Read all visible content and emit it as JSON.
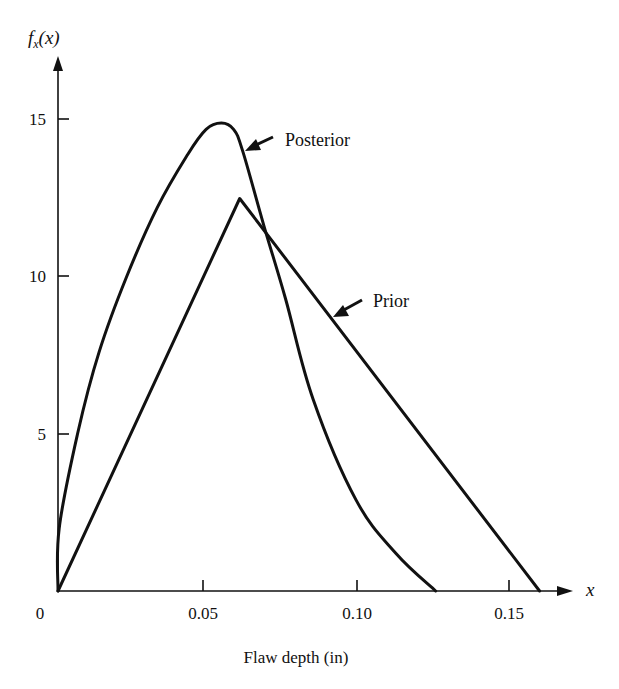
{
  "chart_data": {
    "type": "line",
    "title": "",
    "xlabel": "Flaw depth (in)",
    "ylabel": "f_x(x)",
    "x_axis_symbol": "x",
    "xlim": [
      0,
      0.17
    ],
    "ylim": [
      0,
      17
    ],
    "origin_label": "0",
    "x_ticks": [
      0.05,
      0.1,
      0.15
    ],
    "x_tick_labels": [
      "0.05",
      "0.10",
      "0.15"
    ],
    "y_ticks": [
      5,
      10,
      15
    ],
    "y_tick_labels": [
      "5",
      "10",
      "15"
    ],
    "grid": false,
    "legend": "inline annotations with arrows",
    "series": [
      {
        "name": "Posterior",
        "points": [
          [
            0,
            0
          ],
          [
            0.003,
            2.0
          ],
          [
            0.009,
            5.0
          ],
          [
            0.016,
            7.6
          ],
          [
            0.025,
            10.0
          ],
          [
            0.035,
            12.2
          ],
          [
            0.045,
            13.9
          ],
          [
            0.051,
            14.7
          ],
          [
            0.056,
            14.9
          ],
          [
            0.06,
            14.7
          ],
          [
            0.063,
            14.0
          ],
          [
            0.07,
            11.6
          ],
          [
            0.077,
            9.3
          ],
          [
            0.086,
            6.1
          ],
          [
            0.1,
            2.9
          ],
          [
            0.113,
            1.2
          ],
          [
            0.126,
            0
          ]
        ]
      },
      {
        "name": "Prior",
        "points": [
          [
            0,
            0
          ],
          [
            0.062,
            12.5
          ],
          [
            0.16,
            0
          ]
        ]
      }
    ],
    "annotations": [
      {
        "text": "Posterior",
        "points_to": [
          0.063,
          14.0
        ]
      },
      {
        "text": "Prior",
        "points_to": [
          0.092,
          8.6
        ]
      }
    ]
  },
  "labels": {
    "y_axis": "f",
    "y_axis_sub": "x",
    "y_axis_paren": "(x)",
    "x_axis_symbol": "x",
    "x_title": "Flaw depth (in)",
    "origin": "0",
    "x_tick_1": "0.05",
    "x_tick_2": "0.10",
    "x_tick_3": "0.15",
    "y_tick_1": "5",
    "y_tick_2": "10",
    "y_tick_3": "15",
    "posterior": "Posterior",
    "prior": "Prior"
  },
  "colors": {
    "ink": "#111111",
    "background": "#ffffff"
  }
}
